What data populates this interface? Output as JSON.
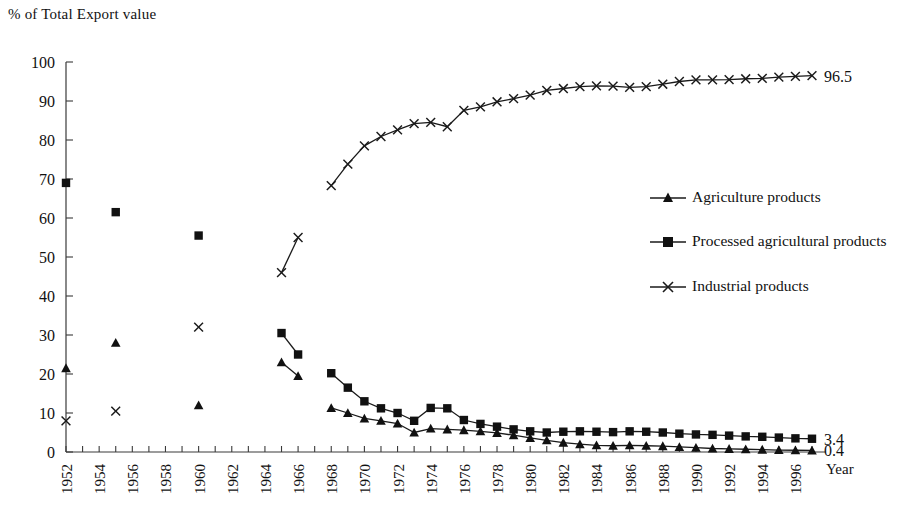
{
  "chart_data": {
    "type": "line",
    "title": "",
    "ylabel": "% of Total Export value",
    "xlabel": "Year",
    "ylim": [
      0,
      100
    ],
    "ytick_labels": [
      "0",
      "10",
      "20",
      "30",
      "40",
      "50",
      "60",
      "70",
      "80",
      "90",
      "100"
    ],
    "xlim": [
      1952,
      1997
    ],
    "xtick_labels": [
      "1952",
      "1954",
      "1956",
      "1958",
      "1960",
      "1962",
      "1964",
      "1966",
      "1968",
      "1970",
      "1972",
      "1974",
      "1976",
      "1978",
      "1980",
      "1982",
      "1984",
      "1986",
      "1988",
      "1990",
      "1992",
      "1994",
      "1996"
    ],
    "grid": false,
    "legend_position": "right-middle",
    "series": [
      {
        "name": "Agriculture products",
        "marker": "triangle",
        "end_label": "0.4",
        "segments": [
          {
            "x": [
              1952
            ],
            "y": [
              21.5
            ]
          },
          {
            "x": [
              1955
            ],
            "y": [
              28.0
            ]
          },
          {
            "x": [
              1960
            ],
            "y": [
              12.0
            ]
          },
          {
            "x": [
              1965,
              1966
            ],
            "y": [
              23.0,
              19.5
            ]
          },
          {
            "x": [
              1968,
              1969,
              1970,
              1971,
              1972,
              1973,
              1974,
              1975,
              1976,
              1977,
              1978,
              1979,
              1980,
              1981,
              1982,
              1983,
              1984,
              1985,
              1986,
              1987,
              1988,
              1989,
              1990,
              1991,
              1992,
              1993,
              1994,
              1995,
              1996,
              1997
            ],
            "y": [
              11.3,
              10.0,
              8.6,
              8.0,
              7.3,
              5.0,
              6.0,
              5.8,
              5.6,
              5.3,
              4.9,
              4.3,
              3.6,
              3.0,
              2.4,
              2.0,
              1.7,
              1.6,
              1.7,
              1.6,
              1.5,
              1.3,
              1.1,
              0.9,
              0.8,
              0.7,
              0.6,
              0.5,
              0.45,
              0.4
            ]
          }
        ]
      },
      {
        "name": "Processed agricultural products",
        "marker": "square",
        "end_label": "3.4",
        "segments": [
          {
            "x": [
              1952
            ],
            "y": [
              69.0
            ]
          },
          {
            "x": [
              1955
            ],
            "y": [
              61.5
            ]
          },
          {
            "x": [
              1960
            ],
            "y": [
              55.5
            ]
          },
          {
            "x": [
              1965,
              1966
            ],
            "y": [
              30.5,
              25.0
            ]
          },
          {
            "x": [
              1968,
              1969,
              1970,
              1971,
              1972,
              1973,
              1974,
              1975,
              1976,
              1977,
              1978,
              1979,
              1980,
              1981,
              1982,
              1983,
              1984,
              1985,
              1986,
              1987,
              1988,
              1989,
              1990,
              1991,
              1992,
              1993,
              1994,
              1995,
              1996,
              1997
            ],
            "y": [
              20.2,
              16.5,
              13.0,
              11.2,
              10.0,
              8.0,
              11.3,
              11.2,
              8.2,
              7.2,
              6.5,
              5.8,
              5.3,
              5.0,
              5.2,
              5.3,
              5.2,
              5.1,
              5.3,
              5.2,
              5.0,
              4.7,
              4.5,
              4.4,
              4.2,
              4.0,
              3.9,
              3.7,
              3.5,
              3.4
            ]
          }
        ]
      },
      {
        "name": "Industrial products",
        "marker": "x",
        "end_label": "96.5",
        "segments": [
          {
            "x": [
              1952
            ],
            "y": [
              8.0
            ]
          },
          {
            "x": [
              1955
            ],
            "y": [
              10.5
            ]
          },
          {
            "x": [
              1960
            ],
            "y": [
              32.0
            ]
          },
          {
            "x": [
              1965,
              1966
            ],
            "y": [
              46.0,
              55.0
            ]
          },
          {
            "x": [
              1968,
              1969,
              1970,
              1971,
              1972,
              1973,
              1974,
              1975,
              1976,
              1977,
              1978,
              1979,
              1980,
              1981,
              1982,
              1983,
              1984,
              1985,
              1986,
              1987,
              1988,
              1989,
              1990,
              1991,
              1992,
              1993,
              1994,
              1995,
              1996,
              1997
            ],
            "y": [
              68.3,
              73.8,
              78.5,
              80.9,
              82.6,
              84.2,
              84.5,
              83.4,
              87.6,
              88.5,
              89.8,
              90.6,
              91.5,
              92.7,
              93.2,
              93.7,
              93.9,
              93.8,
              93.5,
              93.7,
              94.3,
              95.0,
              95.4,
              95.4,
              95.5,
              95.7,
              95.8,
              96.1,
              96.3,
              96.5
            ]
          }
        ]
      }
    ]
  },
  "legend": {
    "items": [
      {
        "label": "Agriculture products",
        "marker": "triangle"
      },
      {
        "label": "Processed agricultural products",
        "marker": "square"
      },
      {
        "label": "Industrial products",
        "marker": "x"
      }
    ]
  }
}
